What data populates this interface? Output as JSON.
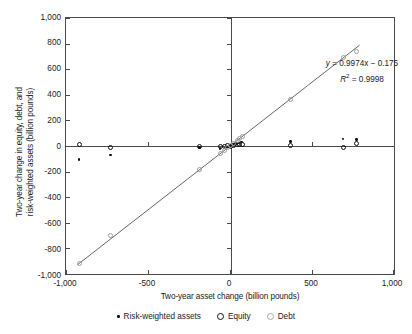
{
  "chart_data": {
    "type": "scatter",
    "title": "",
    "xlabel": "Two-year asset change (billion pounds)",
    "ylabel_line1": "Two-year change in equity, debt, and",
    "ylabel_line2": "risk-weighted assets (billion pounds)",
    "xlim": [
      -1000,
      1000
    ],
    "ylim": [
      -1000,
      1000
    ],
    "xticks": [
      "-1,000",
      "-500",
      "0",
      "500",
      "1,000"
    ],
    "xtick_values": [
      -1000,
      -500,
      0,
      500,
      1000
    ],
    "yticks": [
      "1,000",
      "800",
      "600",
      "400",
      "200",
      "0",
      "-200",
      "-400",
      "-600",
      "-800",
      "-1,000"
    ],
    "ytick_values": [
      1000,
      800,
      600,
      400,
      200,
      0,
      -200,
      -400,
      -600,
      -800,
      -1000
    ],
    "grid": false,
    "legend_position": "bottom",
    "annotations": {
      "equation": "y = 0.9974x − 0.175",
      "equation_y_symbol": "y",
      "equation_rest": " = 0.9974x − 0.175",
      "r_squared_symbol": "R",
      "r_squared_sup": "2",
      "r_squared_rest": " = 0.9998"
    },
    "trendline": {
      "slope": 0.9974,
      "intercept": -0.175,
      "r_squared": 0.9998,
      "x_start": -930,
      "x_end": 790
    },
    "series": [
      {
        "name": "Risk-weighted assets",
        "marker": "filled-circle",
        "color": "#111111",
        "points": [
          [
            -920,
            -105
          ],
          [
            -730,
            -70
          ],
          [
            -185,
            -10
          ],
          [
            -60,
            -20
          ],
          [
            -30,
            -15
          ],
          [
            -10,
            -8
          ],
          [
            10,
            5
          ],
          [
            25,
            10
          ],
          [
            40,
            20
          ],
          [
            55,
            25
          ],
          [
            70,
            30
          ],
          [
            370,
            35
          ],
          [
            690,
            55
          ],
          [
            770,
            50
          ]
        ]
      },
      {
        "name": "Equity",
        "marker": "open-circle",
        "color": "#111111",
        "points": [
          [
            -920,
            8
          ],
          [
            -730,
            -8
          ],
          [
            -185,
            0
          ],
          [
            -60,
            -5
          ],
          [
            -35,
            0
          ],
          [
            -15,
            2
          ],
          [
            5,
            0
          ],
          [
            20,
            5
          ],
          [
            45,
            8
          ],
          [
            60,
            10
          ],
          [
            75,
            12
          ],
          [
            370,
            5
          ],
          [
            690,
            -8
          ],
          [
            770,
            18
          ]
        ]
      },
      {
        "name": "Debt",
        "marker": "open-circle-gray",
        "color": "#9d9d9d",
        "points": [
          [
            -920,
            -920
          ],
          [
            -730,
            -700
          ],
          [
            -185,
            -180
          ],
          [
            -60,
            -60
          ],
          [
            -35,
            -35
          ],
          [
            -15,
            -15
          ],
          [
            5,
            5
          ],
          [
            20,
            20
          ],
          [
            45,
            45
          ],
          [
            60,
            58
          ],
          [
            75,
            72
          ],
          [
            370,
            360
          ],
          [
            690,
            690
          ],
          [
            770,
            740
          ]
        ]
      }
    ]
  },
  "legend": {
    "items": [
      {
        "label": "Risk-weighted assets",
        "marker": "rwa"
      },
      {
        "label": "Equity",
        "marker": "equity"
      },
      {
        "label": "Debt",
        "marker": "debt"
      }
    ]
  }
}
